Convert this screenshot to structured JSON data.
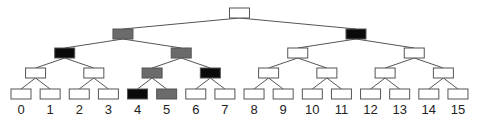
{
  "diagram": {
    "type": "binary-tree",
    "levels": 5,
    "colors": {
      "white": "#ffffff",
      "gray": "#6b6b6b",
      "black": "#0a0a0a",
      "stroke": "#555555"
    },
    "nodes": [
      {
        "id": 1,
        "fill": "white"
      },
      {
        "id": 2,
        "fill": "gray"
      },
      {
        "id": 3,
        "fill": "black"
      },
      {
        "id": 4,
        "fill": "black"
      },
      {
        "id": 5,
        "fill": "gray"
      },
      {
        "id": 6,
        "fill": "white"
      },
      {
        "id": 7,
        "fill": "white"
      },
      {
        "id": 8,
        "fill": "white"
      },
      {
        "id": 9,
        "fill": "white"
      },
      {
        "id": 10,
        "fill": "gray"
      },
      {
        "id": 11,
        "fill": "black"
      },
      {
        "id": 12,
        "fill": "white"
      },
      {
        "id": 13,
        "fill": "white"
      },
      {
        "id": 14,
        "fill": "white"
      },
      {
        "id": 15,
        "fill": "white"
      },
      {
        "id": 16,
        "fill": "white"
      },
      {
        "id": 17,
        "fill": "white"
      },
      {
        "id": 18,
        "fill": "white"
      },
      {
        "id": 19,
        "fill": "white"
      },
      {
        "id": 20,
        "fill": "black"
      },
      {
        "id": 21,
        "fill": "gray"
      },
      {
        "id": 22,
        "fill": "white"
      },
      {
        "id": 23,
        "fill": "white"
      },
      {
        "id": 24,
        "fill": "white"
      },
      {
        "id": 25,
        "fill": "white"
      },
      {
        "id": 26,
        "fill": "white"
      },
      {
        "id": 27,
        "fill": "white"
      },
      {
        "id": 28,
        "fill": "white"
      },
      {
        "id": 29,
        "fill": "white"
      },
      {
        "id": 30,
        "fill": "white"
      },
      {
        "id": 31,
        "fill": "white"
      }
    ],
    "leaf_labels": [
      "0",
      "1",
      "2",
      "3",
      "4",
      "5",
      "6",
      "7",
      "8",
      "9",
      "10",
      "11",
      "12",
      "13",
      "14",
      "15"
    ]
  }
}
